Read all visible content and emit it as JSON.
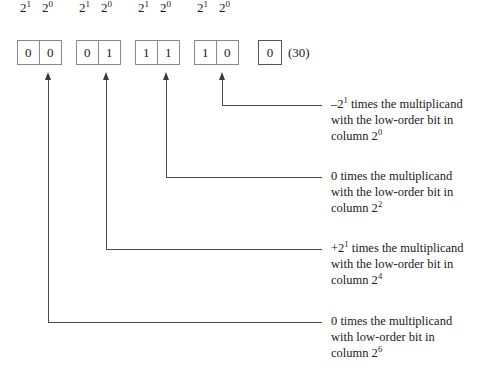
{
  "diagram": {
    "line_color": "#4a4a4a",
    "box_border_color": "#888888",
    "background": "#ffffff",
    "bit_groups": [
      {
        "id": "group-0",
        "exponents": [
          "2",
          "2"
        ],
        "exponent_sups": [
          "1",
          "0"
        ],
        "bits": [
          "0",
          "0"
        ]
      },
      {
        "id": "group-1",
        "exponents": [
          "2",
          "2"
        ],
        "exponent_sups": [
          "1",
          "0"
        ],
        "bits": [
          "0",
          "1"
        ]
      },
      {
        "id": "group-2",
        "exponents": [
          "2",
          "2"
        ],
        "exponent_sups": [
          "1",
          "0"
        ],
        "bits": [
          "1",
          "1"
        ]
      },
      {
        "id": "group-3",
        "exponents": [
          "2",
          "2"
        ],
        "exponent_sups": [
          "1",
          "0"
        ],
        "bits": [
          "1",
          "0"
        ]
      }
    ],
    "extra_bit": {
      "value": "0",
      "note": "(30)"
    },
    "annotations": [
      {
        "id": "annotation-column-0",
        "line1_pre": "–2",
        "line1_sup": "1",
        "line1_post": " times the multiplicand",
        "line2": "with the low-order bit in",
        "line3_pre": "column 2",
        "line3_sup": "0"
      },
      {
        "id": "annotation-column-2",
        "line1_pre": "0",
        "line1_sup": "",
        "line1_post": " times the multiplicand",
        "line2": "with the low-order bit in",
        "line3_pre": "column 2",
        "line3_sup": "2"
      },
      {
        "id": "annotation-column-4",
        "line1_pre": "+2",
        "line1_sup": "1",
        "line1_post": " times the multiplicand",
        "line2": "with the low-order bit in",
        "line3_pre": "column 2",
        "line3_sup": "4"
      },
      {
        "id": "annotation-column-6",
        "line1_pre": "0",
        "line1_sup": "",
        "line1_post": " times the multiplicand",
        "line2": "with low-order bit in",
        "line3_pre": "column 2",
        "line3_sup": "6"
      }
    ]
  }
}
